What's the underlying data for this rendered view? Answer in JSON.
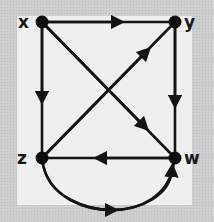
{
  "diagram": {
    "type": "directed-graph",
    "colors": {
      "edge": "#141414",
      "node": "#0d0d0d",
      "label": "#1a1a1a",
      "panel": "#efefef",
      "border": "#cdcdcd"
    },
    "nodes": [
      {
        "id": "x",
        "label": "x",
        "position": "top-left"
      },
      {
        "id": "y",
        "label": "y",
        "position": "top-right"
      },
      {
        "id": "z",
        "label": "z",
        "position": "bottom-left"
      },
      {
        "id": "w",
        "label": "w",
        "position": "bottom-right"
      }
    ],
    "edges": [
      {
        "from": "x",
        "to": "y",
        "shape": "straight"
      },
      {
        "from": "x",
        "to": "z",
        "shape": "straight"
      },
      {
        "from": "x",
        "to": "w",
        "shape": "straight-diagonal"
      },
      {
        "from": "z",
        "to": "y",
        "shape": "straight-diagonal"
      },
      {
        "from": "y",
        "to": "w",
        "shape": "straight"
      },
      {
        "from": "w",
        "to": "z",
        "shape": "straight"
      },
      {
        "from": "z",
        "to": "w",
        "shape": "curved-below"
      }
    ]
  }
}
